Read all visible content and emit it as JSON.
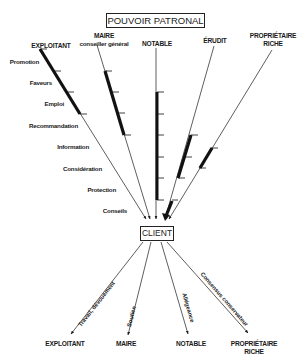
{
  "title": "POUVOIR PATRONAL",
  "center_node": "CLIENT",
  "top_actors": [
    {
      "line1": "EXPLOITANT",
      "line2": ""
    },
    {
      "line1": "MAIRE",
      "line2": "conseiller général"
    },
    {
      "line1": "NOTABLE",
      "line2": ""
    },
    {
      "line1": "ÉRUDIT",
      "line2": ""
    },
    {
      "line1": "PROPRIÉTAIRE",
      "line2": "RICHE"
    }
  ],
  "resources": [
    "Promotion",
    "Faveurs",
    "Emploi",
    "Recommandation",
    "Information",
    "Considération",
    "Protection",
    "Conseils"
  ],
  "bottom_actors": [
    {
      "line1": "EXPLOITANT",
      "line2": "",
      "flow": "Travail, dévouement"
    },
    {
      "line1": "MAIRE",
      "line2": "",
      "flow": "Soutien"
    },
    {
      "line1": "NOTABLE",
      "line2": "",
      "flow": "Allégeance"
    },
    {
      "line1": "PROPRIÉTAIRE",
      "line2": "RICHE",
      "flow": "Consensus conservateur"
    }
  ],
  "colors": {
    "ink": "#1a1a1a",
    "background": "#ffffff"
  }
}
